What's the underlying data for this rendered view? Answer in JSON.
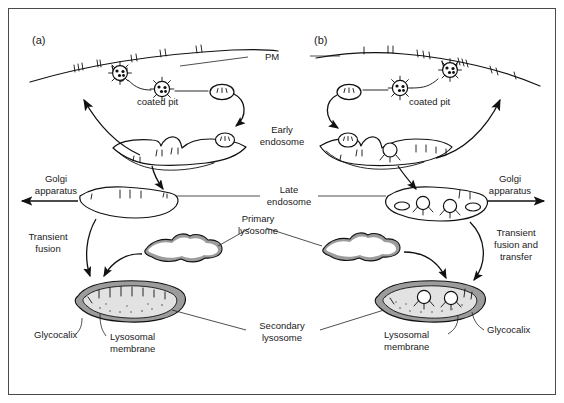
{
  "figure": {
    "title_panels": [
      {
        "id": "a",
        "label": "(a)"
      },
      {
        "id": "b",
        "label": "(b)"
      }
    ],
    "shared_labels": {
      "pm": "PM",
      "early_endosome": "Early\nendosome",
      "early_endosome_line1": "Early",
      "early_endosome_line2": "endosome",
      "late_endosome_line1": "Late",
      "late_endosome_line2": "endosome",
      "primary_lysosome_line1": "Primary",
      "primary_lysosome_line2": "lysosome",
      "secondary_lysosome_line1": "Secondary",
      "secondary_lysosome_line2": "lysosome"
    },
    "panel_a": {
      "coated_pit": "coated pit",
      "golgi_line1": "Golgi",
      "golgi_line2": "apparatus",
      "transient_line1": "Transient",
      "transient_line2": "fusion",
      "glycocalix": "Glycocalix",
      "lysosomal_membrane_line1": "Lysosomal",
      "lysosomal_membrane_line2": "membrane"
    },
    "panel_b": {
      "coated_pit": "coated pit",
      "golgi_line1": "Golgi",
      "golgi_line2": "apparatus",
      "transient_line1": "Transient",
      "transient_line2": "fusion and",
      "transient_line3": "transfer",
      "glycocalix": "Glycocalix",
      "lysosomal_membrane_line1": "Lysosomal",
      "lysosomal_membrane_line2": "membrane"
    },
    "colors": {
      "ink": "#111111",
      "membrane_shade": "#9c9c9c",
      "lumen": "#e2e2e2",
      "frame": "#4a4a4a",
      "background": "#ffffff"
    }
  }
}
